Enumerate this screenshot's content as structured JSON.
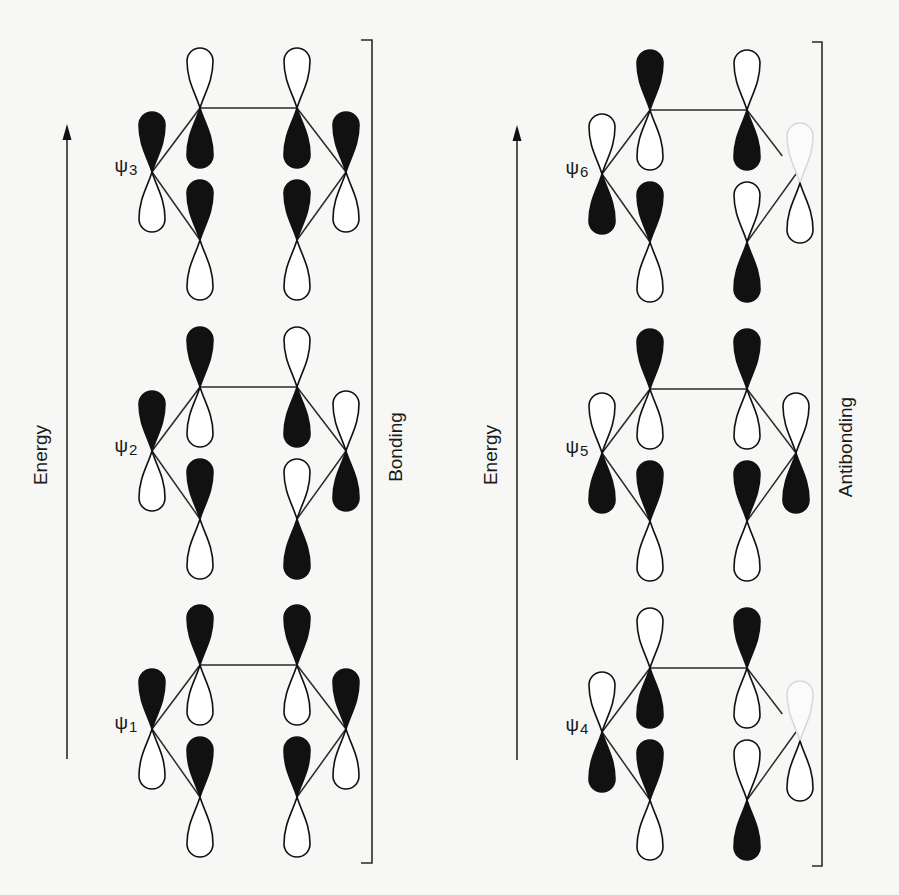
{
  "figure": {
    "panels": [
      {
        "id": "bonding",
        "energy_label": "Energy",
        "group_label": "Bonding",
        "energy_arrow": {
          "x": 67,
          "y_top": 124,
          "y_bottom": 759
        },
        "energy_label_pos": {
          "x": 40,
          "y": 455
        },
        "bracket": {
          "x": 372,
          "x_tick": 361,
          "y_top": 40,
          "y_bottom": 863
        },
        "group_label_pos": {
          "x": 395,
          "y": 447
        },
        "orbitals": [
          {
            "name": "psi3",
            "symbol": "ψ",
            "index": "3",
            "label_pos": {
              "x": 126,
              "y": 166
            },
            "origin": {
              "x": 200,
              "y": 108
            },
            "phases": {
              "TL": "down",
              "TR": "down",
              "L": "up",
              "R": "up",
              "BL": "up",
              "BR": "up"
            },
            "faint_up": []
          },
          {
            "name": "psi2",
            "symbol": "ψ",
            "index": "2",
            "label_pos": {
              "x": 126,
              "y": 446
            },
            "origin": {
              "x": 200,
              "y": 387
            },
            "phases": {
              "TL": "up",
              "TR": "down",
              "L": "up",
              "R": "down",
              "BL": "up",
              "BR": "down"
            },
            "faint_up": []
          },
          {
            "name": "psi1",
            "symbol": "ψ",
            "index": "1",
            "label_pos": {
              "x": 126,
              "y": 723
            },
            "origin": {
              "x": 200,
              "y": 665
            },
            "phases": {
              "TL": "up",
              "TR": "up",
              "L": "up",
              "R": "up",
              "BL": "up",
              "BR": "up"
            },
            "faint_up": []
          }
        ]
      },
      {
        "id": "antibonding",
        "energy_label": "Energy",
        "group_label": "Antibonding",
        "energy_arrow": {
          "x": 517,
          "y_top": 125,
          "y_bottom": 760
        },
        "energy_label_pos": {
          "x": 490,
          "y": 455
        },
        "bracket": {
          "x": 822,
          "x_tick": 812,
          "y_top": 42,
          "y_bottom": 866
        },
        "group_label_pos": {
          "x": 845,
          "y": 447
        },
        "orbitals": [
          {
            "name": "psi6",
            "symbol": "ψ",
            "index": "6",
            "label_pos": {
              "x": 577,
              "y": 168
            },
            "origin": {
              "x": 650,
              "y": 110
            },
            "phases": {
              "TL": "up",
              "TR": "down",
              "L": "down",
              "R": "faint",
              "BL": "up",
              "BR": "down"
            },
            "faint_up": [
              "R"
            ]
          },
          {
            "name": "psi5",
            "symbol": "ψ",
            "index": "5",
            "label_pos": {
              "x": 577,
              "y": 447
            },
            "origin": {
              "x": 650,
              "y": 389
            },
            "phases": {
              "TL": "up",
              "TR": "up",
              "L": "down",
              "R": "down",
              "BL": "up",
              "BR": "up"
            },
            "faint_up": []
          },
          {
            "name": "psi4",
            "symbol": "ψ",
            "index": "4",
            "label_pos": {
              "x": 577,
              "y": 725
            },
            "origin": {
              "x": 650,
              "y": 668
            },
            "phases": {
              "TL": "down",
              "TR": "up",
              "L": "down",
              "R": "faint",
              "BL": "up",
              "BR": "down"
            },
            "faint_up": [
              "R"
            ]
          }
        ]
      }
    ],
    "geometry": {
      "vertex_offsets": {
        "TL": [
          0,
          0
        ],
        "TR": [
          97,
          0
        ],
        "L": [
          -48,
          64
        ],
        "R": [
          146,
          64
        ],
        "BL": [
          0,
          132
        ],
        "BR": [
          97,
          132
        ]
      },
      "lobe_length": 60,
      "lobe_width": 26
    },
    "colors": {
      "ink": "#111111",
      "line": "#2a2a2a",
      "faint": "#d9d9d9",
      "background": "#f7f7f6"
    }
  }
}
